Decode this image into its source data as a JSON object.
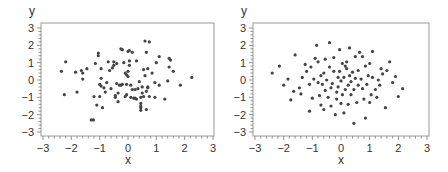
{
  "chart_data": [
    {
      "type": "scatter",
      "title": "",
      "xlabel": "x",
      "ylabel": "y",
      "xlim": [
        -3,
        3
      ],
      "ylim": [
        -3,
        3
      ],
      "xticks": [
        "-3",
        "-2",
        "-1",
        "0",
        "1",
        "2",
        "3"
      ],
      "yticks": [
        "3",
        "2",
        "1",
        "0",
        "-1",
        "-2",
        "-3"
      ],
      "grid": false,
      "marker_color": "#444444",
      "points": [
        [
          -2.35,
          0.5
        ],
        [
          -2.2,
          1.05
        ],
        [
          -2.25,
          -0.85
        ],
        [
          -1.85,
          0.45
        ],
        [
          -1.8,
          -0.7
        ],
        [
          -1.65,
          0.55
        ],
        [
          -1.6,
          0.4
        ],
        [
          -1.6,
          0.05
        ],
        [
          -1.45,
          0.65
        ],
        [
          -1.3,
          -2.3
        ],
        [
          -1.22,
          -2.3
        ],
        [
          -1.2,
          -0.95
        ],
        [
          -1.15,
          0.95
        ],
        [
          -1.1,
          -1.45
        ],
        [
          -1.05,
          1.55
        ],
        [
          -1.05,
          1.4
        ],
        [
          -1.0,
          -0.95
        ],
        [
          -1.0,
          -0.25
        ],
        [
          -0.95,
          0.65
        ],
        [
          -0.95,
          0.1
        ],
        [
          -0.95,
          -0.35
        ],
        [
          -0.9,
          -1.6
        ],
        [
          -0.85,
          -0.45
        ],
        [
          -0.75,
          -0.15
        ],
        [
          -0.8,
          -0.7
        ],
        [
          -0.7,
          1.05
        ],
        [
          -0.65,
          0.55
        ],
        [
          -0.6,
          -0.5
        ],
        [
          -0.55,
          0.7
        ],
        [
          -0.5,
          1.05
        ],
        [
          -0.5,
          0.85
        ],
        [
          -0.45,
          -0.9
        ],
        [
          -0.45,
          -1.0
        ],
        [
          -0.4,
          0.95
        ],
        [
          -0.4,
          -0.2
        ],
        [
          -0.35,
          -1.25
        ],
        [
          -0.35,
          -0.75
        ],
        [
          -0.3,
          -0.3
        ],
        [
          -0.25,
          -0.3
        ],
        [
          -0.25,
          1.8
        ],
        [
          -0.2,
          1.75
        ],
        [
          -0.2,
          -0.25
        ],
        [
          -0.15,
          1.0
        ],
        [
          -0.1,
          0.4
        ],
        [
          -0.1,
          -0.95
        ],
        [
          -0.05,
          -0.85
        ],
        [
          -0.05,
          0.3
        ],
        [
          -0.05,
          -0.25
        ],
        [
          0.0,
          0.2
        ],
        [
          0.0,
          0.5
        ],
        [
          0.0,
          1.65
        ],
        [
          0.05,
          1.7
        ],
        [
          0.05,
          1.1
        ],
        [
          0.05,
          0.85
        ],
        [
          0.1,
          -0.3
        ],
        [
          0.1,
          -1.0
        ],
        [
          0.15,
          1.6
        ],
        [
          0.15,
          -0.55
        ],
        [
          0.2,
          -1.05
        ],
        [
          0.25,
          -0.55
        ],
        [
          0.25,
          -1.05
        ],
        [
          0.3,
          1.1
        ],
        [
          0.3,
          -1.1
        ],
        [
          0.35,
          -0.5
        ],
        [
          0.4,
          -0.1
        ],
        [
          0.45,
          -1.0
        ],
        [
          0.45,
          -1.35
        ],
        [
          0.45,
          -1.5
        ],
        [
          0.45,
          -1.6
        ],
        [
          0.45,
          -1.75
        ],
        [
          0.5,
          -0.4
        ],
        [
          0.5,
          -0.75
        ],
        [
          0.55,
          -0.95
        ],
        [
          0.55,
          0.6
        ],
        [
          0.6,
          0.25
        ],
        [
          0.6,
          2.25
        ],
        [
          0.65,
          1.6
        ],
        [
          0.65,
          -0.65
        ],
        [
          0.65,
          -1.7
        ],
        [
          0.7,
          0.65
        ],
        [
          0.7,
          -0.4
        ],
        [
          0.7,
          -0.45
        ],
        [
          0.75,
          2.2
        ],
        [
          0.75,
          -0.95
        ],
        [
          0.85,
          0.4
        ],
        [
          0.95,
          -0.15
        ],
        [
          0.95,
          -1.0
        ],
        [
          1.0,
          1.0
        ],
        [
          1.1,
          1.35
        ],
        [
          1.1,
          -0.3
        ],
        [
          1.3,
          -1.1
        ],
        [
          1.4,
          -0.05
        ],
        [
          1.45,
          1.25
        ],
        [
          1.45,
          0.75
        ],
        [
          1.5,
          1.15
        ],
        [
          1.6,
          0.5
        ],
        [
          1.85,
          -0.3
        ],
        [
          2.25,
          0.15
        ]
      ]
    },
    {
      "type": "scatter",
      "title": "",
      "xlabel": "x",
      "ylabel": "y",
      "xlim": [
        -3,
        3
      ],
      "ylim": [
        -3,
        3
      ],
      "xticks": [
        "-3",
        "-2",
        "-1",
        "0",
        "1",
        "2",
        "3"
      ],
      "yticks": [
        "3",
        "2",
        "1",
        "0",
        "-1",
        "-2",
        "-3"
      ],
      "grid": false,
      "marker_color": "#444444",
      "points": [
        [
          -2.4,
          0.4
        ],
        [
          -2.15,
          0.8
        ],
        [
          -2.0,
          -0.3
        ],
        [
          -1.85,
          0.05
        ],
        [
          -1.75,
          -1.15
        ],
        [
          -1.65,
          -0.65
        ],
        [
          -1.6,
          1.45
        ],
        [
          -1.45,
          -0.45
        ],
        [
          -1.4,
          -0.8
        ],
        [
          -1.35,
          0.15
        ],
        [
          -1.25,
          0.9
        ],
        [
          -1.2,
          0.5
        ],
        [
          -1.1,
          -1.8
        ],
        [
          -1.1,
          -0.25
        ],
        [
          -1.05,
          0.75
        ],
        [
          -1.0,
          -1.05
        ],
        [
          -0.95,
          0.05
        ],
        [
          -0.9,
          1.25
        ],
        [
          -0.85,
          2.0
        ],
        [
          -0.8,
          1.05
        ],
        [
          -0.8,
          -0.15
        ],
        [
          -0.75,
          -0.9
        ],
        [
          -0.7,
          0.25
        ],
        [
          -0.7,
          -1.45
        ],
        [
          -0.65,
          -0.25
        ],
        [
          -0.6,
          0.4
        ],
        [
          -0.6,
          -1.7
        ],
        [
          -0.55,
          1.2
        ],
        [
          -0.55,
          -0.6
        ],
        [
          -0.5,
          0.0
        ],
        [
          -0.45,
          -1.0
        ],
        [
          -0.4,
          2.15
        ],
        [
          -0.4,
          0.75
        ],
        [
          -0.35,
          -0.45
        ],
        [
          -0.35,
          -1.5
        ],
        [
          -0.3,
          -0.2
        ],
        [
          -0.25,
          1.3
        ],
        [
          -0.25,
          0.5
        ],
        [
          -0.2,
          -2.0
        ],
        [
          -0.15,
          -0.7
        ],
        [
          -0.15,
          -1.1
        ],
        [
          -0.1,
          0.15
        ],
        [
          -0.1,
          -0.4
        ],
        [
          -0.05,
          1.75
        ],
        [
          -0.05,
          0.5
        ],
        [
          0.0,
          -1.35
        ],
        [
          0.0,
          -0.05
        ],
        [
          0.05,
          -0.85
        ],
        [
          0.05,
          0.95
        ],
        [
          0.1,
          -1.9
        ],
        [
          0.1,
          0.15
        ],
        [
          0.15,
          0.8
        ],
        [
          0.15,
          -0.55
        ],
        [
          0.2,
          1.05
        ],
        [
          0.2,
          0.65
        ],
        [
          0.25,
          -1.4
        ],
        [
          0.25,
          -0.3
        ],
        [
          0.3,
          1.85
        ],
        [
          0.3,
          0.25
        ],
        [
          0.35,
          -0.85
        ],
        [
          0.35,
          -0.1
        ],
        [
          0.4,
          0.45
        ],
        [
          0.45,
          -2.5
        ],
        [
          0.45,
          -0.55
        ],
        [
          0.5,
          1.35
        ],
        [
          0.5,
          0.1
        ],
        [
          0.55,
          -1.3
        ],
        [
          0.6,
          0.55
        ],
        [
          0.6,
          -0.3
        ],
        [
          0.65,
          1.6
        ],
        [
          0.7,
          0.05
        ],
        [
          0.75,
          -0.5
        ],
        [
          0.75,
          1.35
        ],
        [
          0.8,
          -1.1
        ],
        [
          0.85,
          0.8
        ],
        [
          0.85,
          -2.2
        ],
        [
          0.9,
          -0.25
        ],
        [
          0.95,
          0.25
        ],
        [
          1.0,
          -1.3
        ],
        [
          1.0,
          0.95
        ],
        [
          1.05,
          -0.85
        ],
        [
          1.1,
          0.15
        ],
        [
          1.1,
          1.65
        ],
        [
          1.2,
          -0.55
        ],
        [
          1.25,
          -1.0
        ],
        [
          1.3,
          0.0
        ],
        [
          1.35,
          -0.3
        ],
        [
          1.4,
          0.65
        ],
        [
          1.45,
          0.35
        ],
        [
          1.55,
          -1.6
        ],
        [
          1.6,
          0.55
        ],
        [
          1.7,
          1.05
        ],
        [
          1.8,
          -0.15
        ],
        [
          1.9,
          0.2
        ],
        [
          2.0,
          -0.95
        ],
        [
          2.15,
          -0.5
        ]
      ]
    }
  ]
}
